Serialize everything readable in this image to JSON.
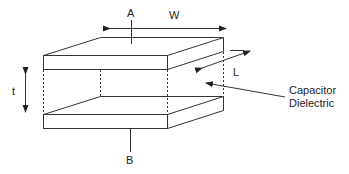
{
  "diagram": {
    "labels": {
      "plate_top": "A",
      "plate_bottom": "B",
      "width": "W",
      "length": "L",
      "thickness": "t",
      "dielectric_line1": "Capacitor",
      "dielectric_line2": "Dielectric"
    },
    "colors": {
      "stroke": "#333333",
      "background": "#ffffff"
    }
  }
}
